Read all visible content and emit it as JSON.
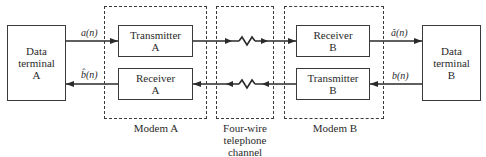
{
  "diagram": {
    "terminal_a": {
      "line1": "Data",
      "line2": "terminal",
      "line3": "A"
    },
    "terminal_b": {
      "line1": "Data",
      "line2": "terminal",
      "line3": "B"
    },
    "transmitter_a": {
      "line1": "Transmitter",
      "line2": "A"
    },
    "receiver_a": {
      "line1": "Receiver",
      "line2": "A"
    },
    "receiver_b": {
      "line1": "Receiver",
      "line2": "B"
    },
    "transmitter_b": {
      "line1": "Transmitter",
      "line2": "B"
    },
    "modem_a_label": "Modem A",
    "modem_b_label": "Modem B",
    "channel_label": {
      "line1": "Four-wire",
      "line2": "telephone",
      "line3": "channel"
    },
    "signals": {
      "a_n": "a(n)",
      "b_hat_n": "b̂(n)",
      "a_hat_n": "â(n)",
      "b_n": "b(n)"
    },
    "colors": {
      "line": "#2a2a2a",
      "background": "#ffffff"
    }
  }
}
